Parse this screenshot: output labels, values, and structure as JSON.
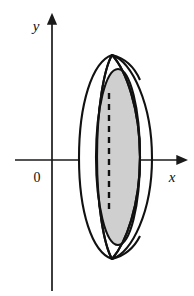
{
  "figure": {
    "background_color": "#ffffff",
    "width": 194,
    "height": 296
  },
  "axes": {
    "stroke_color": "#1a1a1a",
    "x_axis": {
      "label": "x",
      "label_x": 170,
      "label_y": 180,
      "y_position": 160,
      "x_start": 15,
      "x_end": 183,
      "arrow": "right"
    },
    "y_axis": {
      "label": "y",
      "label_x": 36,
      "label_y": 30,
      "x_position": 52,
      "y_start": 18,
      "y_end": 291,
      "arrow": "up"
    },
    "origin": {
      "label": "0",
      "label_x": 34,
      "label_y": 181
    }
  },
  "solid": {
    "outline_color": "#111111",
    "outline_width": 2.1,
    "shade_color": "#cfcfcf",
    "shade_edge_color": "#111111",
    "dashed_line_color": "#111111",
    "dash_pattern": "6,5",
    "description": "Lens shaped region revolved about a vertical axis forming a solid with a shaded circular cross-section disk"
  },
  "geometry": {
    "outer_left_ellipse": {
      "cx": 103,
      "cy": 158,
      "rx": 25,
      "ry": 100
    },
    "outer_right_ellipse": {
      "cx": 127,
      "cy": 158,
      "rx": 25,
      "ry": 100
    },
    "shaded_disk": {
      "cx": 118,
      "cy": 157,
      "rx": 22,
      "ry": 88
    },
    "dashed_axis": {
      "x": 109,
      "y_top": 93,
      "y_bottom": 214
    },
    "apex_top": {
      "x": 112,
      "y": 55
    },
    "apex_bottom": {
      "x": 112,
      "y": 259
    }
  },
  "labels": {
    "x": "x",
    "y": "y",
    "origin": "0"
  }
}
